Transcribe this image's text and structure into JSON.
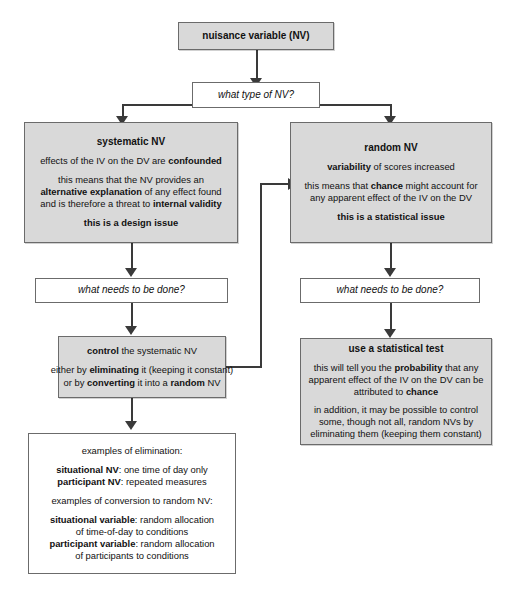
{
  "diagram": {
    "colors": {
      "fill": "#d9d9d9",
      "border": "#6b6b6b",
      "line": "#3a3a3a",
      "page": "#ffffff"
    }
  },
  "nodes": {
    "root": {
      "label": "nuisance variable (NV)"
    },
    "question_type": {
      "label": "what type of NV?"
    },
    "systematic": {
      "heading": "systematic NV",
      "line1_a": "effects of the IV on the DV are ",
      "line1_b": "confounded",
      "line2": "this means that the NV provides an",
      "line3_a": "alternative explanation",
      "line3_b": " of any effect found",
      "line4_a": "and is therefore a threat to ",
      "line4_b": "internal validity",
      "line5": "this is a design issue"
    },
    "random": {
      "heading": "random NV",
      "line1_a": "variability",
      "line1_b": " of scores increased",
      "line2_a": "this means that ",
      "line2_b": "chance",
      "line2_c": " might account for",
      "line3": "any apparent effect of the IV on the DV",
      "line4": "this is a statistical issue"
    },
    "question_left": {
      "label": "what needs to be done?"
    },
    "question_right": {
      "label": "what needs to be done?"
    },
    "control": {
      "line1_a": "control",
      "line1_b": " the systematic NV",
      "line2_a": "either by ",
      "line2_b": "eliminating",
      "line2_c": " it (keeping it constant)",
      "line3_a": "or by ",
      "line3_b": "converting",
      "line3_c": " it into a ",
      "line3_d": "random",
      "line3_e": " NV"
    },
    "statistical": {
      "heading": "use a statistical test",
      "line1_a": "this will tell you the ",
      "line1_b": "probability",
      "line1_c": " that any",
      "line2": "apparent effect of the IV on the DV can be",
      "line3_a": "attributed to ",
      "line3_b": "chance",
      "line4": "in addition, it may be possible to control",
      "line5": "some, though not all, random NVs by",
      "line6": "eliminating them (keeping them constant)"
    },
    "examples": {
      "line1": "examples of elimination:",
      "line2_a": "situational NV",
      "line2_b": ": one time of day only",
      "line3_a": "participant NV",
      "line3_b": ": repeated measures",
      "line4": "examples of conversion to random NV:",
      "line5_a": "situational variable",
      "line5_b": ": random allocation",
      "line6": "of time-of-day to conditions",
      "line7_a": "participant variable",
      "line7_b": ": random allocation",
      "line8": "of participants to conditions"
    }
  }
}
